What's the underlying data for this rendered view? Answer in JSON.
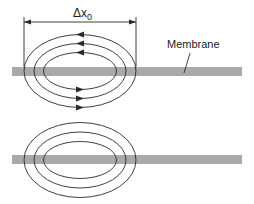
{
  "figure": {
    "dimension_label": "Δx",
    "dimension_subscript": "0",
    "membrane_label": "Membrane",
    "colors": {
      "membrane": "#a9a9a9",
      "line": "#2a2a2a",
      "background": "#ffffff"
    },
    "top_panel": {
      "loops": 3,
      "arrow_direction_top": "left",
      "arrow_direction_bottom": "right"
    },
    "bottom_panel": {
      "loops": 3,
      "arrows": "none"
    }
  }
}
